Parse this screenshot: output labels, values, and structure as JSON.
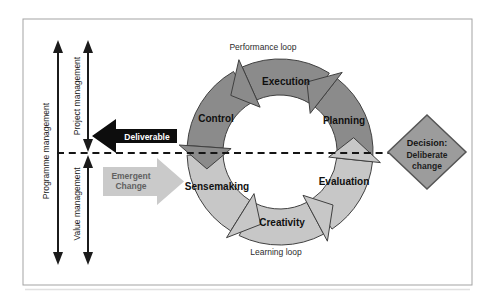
{
  "diagram": {
    "left_panel": {
      "programme_label": "Programme management",
      "project_label": "Project management",
      "value_label": "Value management"
    },
    "flows": {
      "deliverable_label": "Deliverable",
      "emergent_line1": "Emergent",
      "emergent_line2": "Change"
    },
    "loop": {
      "performance_caption": "Performance loop",
      "learning_caption": "Learning loop",
      "stages": {
        "execution": "Execution",
        "control": "Control",
        "planning": "Planning",
        "sensemaking": "Sensemaking",
        "creativity": "Creativity",
        "evaluation": "Evaluation"
      }
    },
    "decision": {
      "line1": "Decision:",
      "line2": "Deliberate",
      "line3": "change"
    },
    "colors": {
      "performance_loop": "#8b8b8b",
      "learning_loop": "#c7c7c7",
      "outline": "#404040",
      "deliverable_arrow": "#0d0d0d",
      "emergent_arrow": "#cacaca",
      "decision_diamond": "#9c9c9c",
      "decision_border": "#555555",
      "line_color": "#1b1b1b"
    }
  }
}
